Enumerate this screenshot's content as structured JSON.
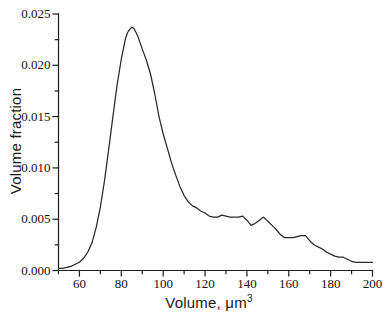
{
  "figure": {
    "background": "#ffffff",
    "axis_color": "#1c1c1c",
    "tick_label_color": "#111111"
  },
  "chart_data": {
    "type": "line",
    "xlabel": "Volume, μm³",
    "xlabel_main": "Volume, μm",
    "xlabel_sup": "3",
    "ylabel": "Volume fraction",
    "xlim": [
      50,
      200
    ],
    "ylim": [
      0,
      0.025
    ],
    "grid": false,
    "legend": "none",
    "x_major_ticks": [
      60,
      80,
      100,
      120,
      140,
      160,
      180,
      200
    ],
    "x_tick_labels": [
      "60",
      "80",
      "100",
      "120",
      "140",
      "160",
      "180",
      "200"
    ],
    "x_minor_ticks": [
      50,
      70,
      90,
      110,
      130,
      150,
      170,
      190
    ],
    "y_major_ticks": [
      0,
      0.005,
      0.01,
      0.015,
      0.02,
      0.025
    ],
    "y_tick_labels": [
      "0.000",
      "0.005",
      "0.010",
      "0.015",
      "0.020",
      "0.025"
    ],
    "y_minor_ticks": [
      0.0025,
      0.0075,
      0.0125,
      0.0175,
      0.0225
    ],
    "series": [
      {
        "name": "volume-fraction-distribution",
        "color": "#2a2a2a",
        "width": 1.25,
        "points": [
          [
            50,
            0.0002
          ],
          [
            52,
            0.0002
          ],
          [
            54,
            0.0003
          ],
          [
            56,
            0.0004
          ],
          [
            58,
            0.0006
          ],
          [
            60,
            0.0008
          ],
          [
            62,
            0.0012
          ],
          [
            64,
            0.0018
          ],
          [
            66,
            0.0027
          ],
          [
            68,
            0.0042
          ],
          [
            70,
            0.0062
          ],
          [
            72,
            0.0088
          ],
          [
            74,
            0.0118
          ],
          [
            76,
            0.015
          ],
          [
            78,
            0.0181
          ],
          [
            80,
            0.0206
          ],
          [
            82,
            0.0226
          ],
          [
            83,
            0.0232
          ],
          [
            84,
            0.0235
          ],
          [
            85,
            0.0237
          ],
          [
            86,
            0.0236
          ],
          [
            87,
            0.0232
          ],
          [
            88,
            0.0228
          ],
          [
            90,
            0.0216
          ],
          [
            92,
            0.0205
          ],
          [
            94,
            0.0191
          ],
          [
            96,
            0.0172
          ],
          [
            98,
            0.015
          ],
          [
            100,
            0.0133
          ],
          [
            102,
            0.0119
          ],
          [
            104,
            0.0105
          ],
          [
            106,
            0.0093
          ],
          [
            108,
            0.0082
          ],
          [
            110,
            0.0073
          ],
          [
            112,
            0.0067
          ],
          [
            114,
            0.0063
          ],
          [
            116,
            0.0061
          ],
          [
            118,
            0.0058
          ],
          [
            120,
            0.0056
          ],
          [
            122,
            0.0053
          ],
          [
            124,
            0.0052
          ],
          [
            126,
            0.0052
          ],
          [
            128,
            0.0054
          ],
          [
            130,
            0.0053
          ],
          [
            132,
            0.0052
          ],
          [
            134,
            0.0052
          ],
          [
            136,
            0.0052
          ],
          [
            138,
            0.0053
          ],
          [
            140,
            0.0049
          ],
          [
            142,
            0.0044
          ],
          [
            144,
            0.0046
          ],
          [
            146,
            0.0049
          ],
          [
            148,
            0.0052
          ],
          [
            150,
            0.0048
          ],
          [
            152,
            0.0044
          ],
          [
            154,
            0.004
          ],
          [
            156,
            0.0035
          ],
          [
            158,
            0.0032
          ],
          [
            160,
            0.0032
          ],
          [
            162,
            0.0032
          ],
          [
            164,
            0.0033
          ],
          [
            166,
            0.0034
          ],
          [
            168,
            0.0034
          ],
          [
            170,
            0.0029
          ],
          [
            172,
            0.0025
          ],
          [
            174,
            0.0023
          ],
          [
            176,
            0.0021
          ],
          [
            178,
            0.0018
          ],
          [
            180,
            0.0016
          ],
          [
            182,
            0.0014
          ],
          [
            184,
            0.0013
          ],
          [
            186,
            0.0013
          ],
          [
            188,
            0.0011
          ],
          [
            190,
            0.0009
          ],
          [
            192,
            0.0008
          ],
          [
            194,
            0.0008
          ],
          [
            196,
            0.0008
          ],
          [
            198,
            0.0008
          ],
          [
            200,
            0.0008
          ]
        ]
      }
    ]
  }
}
